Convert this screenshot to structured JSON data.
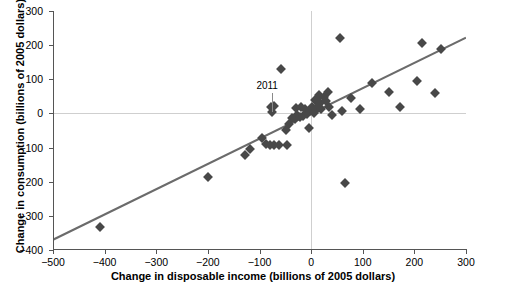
{
  "chart_data": {
    "type": "scatter",
    "title": "",
    "xlabel": "Change in disposable income (billions of 2005 dollars)",
    "ylabel": "Change in consumption (billions of 2005 dollars)",
    "xlim": [
      -500,
      300
    ],
    "ylim": [
      -400,
      300
    ],
    "xticks": [
      -500,
      -400,
      -300,
      -200,
      -100,
      0,
      100,
      200,
      300
    ],
    "xtick_labels": [
      "−500",
      "−400",
      "−300",
      "−200",
      "−100",
      "0",
      "100",
      "200",
      "300"
    ],
    "yticks": [
      -400,
      -300,
      -200,
      -100,
      0,
      100,
      200,
      300
    ],
    "ytick_labels": [
      "−400",
      "−300",
      "−200",
      "−100",
      "0",
      "100",
      "200",
      "300"
    ],
    "grid": false,
    "zero_lines": true,
    "legend": null,
    "marker": "diamond",
    "marker_color": "#484848",
    "line_color": "#6b6b6b",
    "axis_color": "#555555",
    "gridline_color": "#cfcfcf",
    "background": "#ffffff",
    "trendline": {
      "type": "linear",
      "x_start": -500,
      "y_start": -370,
      "x_end": 300,
      "y_end": 222,
      "slope": 0.74,
      "intercept": 0
    },
    "annotations": [
      {
        "text": "2011",
        "x": -75,
        "y": 55,
        "point_x": -75,
        "point_y": 5
      }
    ],
    "points": [
      {
        "x": -408,
        "y": -332
      },
      {
        "x": -200,
        "y": -185
      },
      {
        "x": -128,
        "y": -122
      },
      {
        "x": -118,
        "y": -105
      },
      {
        "x": -95,
        "y": -72
      },
      {
        "x": -88,
        "y": -90
      },
      {
        "x": -80,
        "y": -92
      },
      {
        "x": -72,
        "y": -92
      },
      {
        "x": -62,
        "y": -92
      },
      {
        "x": -78,
        "y": 20
      },
      {
        "x": -72,
        "y": 22
      },
      {
        "x": -75,
        "y": 5
      },
      {
        "x": -58,
        "y": 130
      },
      {
        "x": -46,
        "y": -92
      },
      {
        "x": -48,
        "y": -48
      },
      {
        "x": -42,
        "y": -30
      },
      {
        "x": -38,
        "y": -12
      },
      {
        "x": -32,
        "y": -16
      },
      {
        "x": -30,
        "y": 15
      },
      {
        "x": -28,
        "y": -5
      },
      {
        "x": -22,
        "y": -10
      },
      {
        "x": -20,
        "y": 18
      },
      {
        "x": -15,
        "y": -8
      },
      {
        "x": -12,
        "y": 12
      },
      {
        "x": -8,
        "y": -2
      },
      {
        "x": -5,
        "y": -42
      },
      {
        "x": -2,
        "y": 8
      },
      {
        "x": 2,
        "y": 20
      },
      {
        "x": 5,
        "y": 0
      },
      {
        "x": 8,
        "y": 38
      },
      {
        "x": 10,
        "y": 10
      },
      {
        "x": 12,
        "y": 42
      },
      {
        "x": 14,
        "y": 22
      },
      {
        "x": 16,
        "y": 55
      },
      {
        "x": 18,
        "y": 30
      },
      {
        "x": 20,
        "y": 12
      },
      {
        "x": 24,
        "y": 48
      },
      {
        "x": 28,
        "y": 35
      },
      {
        "x": 32,
        "y": 62
      },
      {
        "x": 35,
        "y": 20
      },
      {
        "x": 40,
        "y": -5
      },
      {
        "x": 55,
        "y": 220
      },
      {
        "x": 60,
        "y": 8
      },
      {
        "x": 65,
        "y": -205
      },
      {
        "x": 78,
        "y": 45
      },
      {
        "x": 95,
        "y": 12
      },
      {
        "x": 118,
        "y": 88
      },
      {
        "x": 150,
        "y": 62
      },
      {
        "x": 172,
        "y": 18
      },
      {
        "x": 205,
        "y": 95
      },
      {
        "x": 215,
        "y": 205
      },
      {
        "x": 240,
        "y": 60
      },
      {
        "x": 252,
        "y": 188
      }
    ]
  }
}
